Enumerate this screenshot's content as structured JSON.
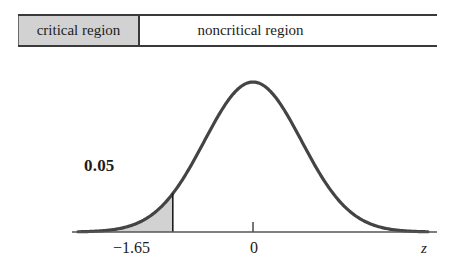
{
  "figure": {
    "title": "",
    "axis_variable": "z",
    "alpha_label": "0.05"
  },
  "region_bar": {
    "critical_label": "critical region",
    "noncritical_label": "noncritical region",
    "divider_z": -1.65,
    "critical_fill_color": "#d2d2d2",
    "noncritical_fill_color": "#ffffff",
    "border_color": "#3a3a3a"
  },
  "axis": {
    "tick_labels": [
      "−1.65",
      "0"
    ],
    "tick_values": [
      -1.65,
      0
    ],
    "variable": "z",
    "color": "#555555"
  },
  "chart_data": {
    "type": "area",
    "title": "",
    "subtitle": "",
    "xlabel": "z",
    "ylabel": "",
    "xlim": [
      -3.6,
      3.6
    ],
    "ylim": [
      0,
      0.43
    ],
    "grid": false,
    "legend": null,
    "curve": {
      "name": "standard normal density",
      "distribution": "normal",
      "mean": 0,
      "sd": 1,
      "color": "#444444",
      "line_width": 3
    },
    "shaded_regions": [
      {
        "name": "critical region (left tail)",
        "x_from": -3.6,
        "x_to": -1.65,
        "area": 0.05,
        "label": "0.05",
        "fill_color": "#d2d2d2"
      }
    ],
    "vertical_lines": [
      {
        "x": -1.65,
        "from_y": 0,
        "to_y": 0.1023,
        "color": "#1c1c1c"
      }
    ],
    "annotations": [
      {
        "text": "0.05",
        "x": -2.45,
        "y": 0.26,
        "bold": true
      },
      {
        "text": "critical region",
        "x": -2.6,
        "y": 0.47
      },
      {
        "text": "noncritical region",
        "x": 0.45,
        "y": 0.47
      }
    ],
    "ticks": [
      {
        "value": -1.65,
        "label": "−1.65"
      },
      {
        "value": 0,
        "label": "0"
      }
    ]
  }
}
